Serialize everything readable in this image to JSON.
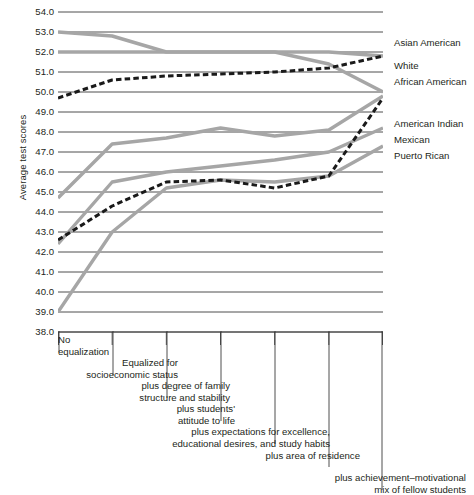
{
  "chart_data": {
    "type": "line",
    "title": "",
    "xlabel": "",
    "ylabel": "Average test scores",
    "ylim": [
      38.0,
      54.0
    ],
    "ytick_labels": [
      "54.0",
      "53.0",
      "52.0",
      "51.0",
      "50.0",
      "49.0",
      "48.0",
      "47.0",
      "46.0",
      "45.0",
      "44.0",
      "43.0",
      "42.0",
      "41.0",
      "40.0",
      "39.0",
      "38.0"
    ],
    "ytick_values": [
      54.0,
      53.0,
      52.0,
      51.0,
      50.0,
      49.0,
      48.0,
      47.0,
      46.0,
      45.0,
      44.0,
      43.0,
      42.0,
      41.0,
      40.0,
      39.0,
      38.0
    ],
    "grid": true,
    "legend_position": "right",
    "categories": [
      "No equalization",
      "Equalized for socioeconomic status",
      "plus degree of family structure and stability",
      "plus students' attitude to life",
      "plus expectations for excellence, educational desires, and study habits",
      "plus area of residence",
      "plus achievement–motivational mix of fellow students"
    ],
    "category_captions": [
      {
        "id": "stage-0",
        "lines": [
          "No",
          "equalization"
        ]
      },
      {
        "id": "stage-1",
        "lines": [
          "Equalized for",
          "socioeconomic status"
        ]
      },
      {
        "id": "stage-2",
        "lines": [
          "plus degree of family",
          "structure and stability"
        ]
      },
      {
        "id": "stage-3",
        "lines": [
          "plus students'",
          "attitude to life"
        ]
      },
      {
        "id": "stage-4",
        "lines": [
          "plus expectations for excellence,",
          "educational desires, and study habits"
        ]
      },
      {
        "id": "stage-5",
        "lines": [
          "plus area of residence"
        ]
      },
      {
        "id": "stage-6",
        "lines": [
          "plus achievement–motivational",
          "mix of fellow students"
        ]
      }
    ],
    "series": [
      {
        "name": "Asian American",
        "style": "solid-gray",
        "color": "#a6a6a6",
        "values": [
          53.0,
          52.8,
          52.0,
          52.0,
          52.0,
          52.0,
          51.8
        ]
      },
      {
        "name": "White",
        "style": "solid-gray",
        "color": "#a6a6a6",
        "values": [
          52.0,
          52.0,
          52.0,
          52.0,
          52.0,
          51.4,
          50.0
        ]
      },
      {
        "name": "African American",
        "style": "dashed-black",
        "color": "#1a1a1a",
        "values": [
          49.7,
          50.6,
          50.8,
          50.9,
          51.0,
          51.2,
          51.8
        ]
      },
      {
        "name": "American Indian",
        "style": "solid-gray",
        "color": "#a6a6a6",
        "values": [
          44.7,
          47.4,
          47.7,
          48.2,
          47.8,
          48.1,
          49.8
        ]
      },
      {
        "name": "Mexican",
        "style": "solid-gray",
        "color": "#a6a6a6",
        "values": [
          42.4,
          45.5,
          46.0,
          46.3,
          46.6,
          47.0,
          48.2
        ]
      },
      {
        "name": "Puerto Rican",
        "style": "solid-gray",
        "color": "#a6a6a6",
        "values": [
          39.0,
          43.0,
          45.2,
          45.6,
          45.5,
          45.8,
          47.3
        ]
      },
      {
        "name": "African American lower",
        "style": "dashed-black",
        "color": "#1a1a1a",
        "values": [
          42.6,
          44.3,
          45.5,
          45.6,
          45.2,
          45.8,
          49.7
        ]
      }
    ],
    "legend_entries": [
      {
        "label": "Asian American",
        "y": 43
      },
      {
        "label": "White",
        "y": 66
      },
      {
        "label": "African American",
        "y": 82
      },
      {
        "label": "American Indian",
        "y": 124
      },
      {
        "label": "Mexican",
        "y": 140
      },
      {
        "label": "Puerto Rican",
        "y": 156
      }
    ]
  },
  "colors": {
    "gray_series": "#a6a6a6",
    "dashed_series": "#1a1a1a",
    "gridline": "#3b3b3b",
    "text": "#231f20",
    "background": "#ffffff"
  }
}
